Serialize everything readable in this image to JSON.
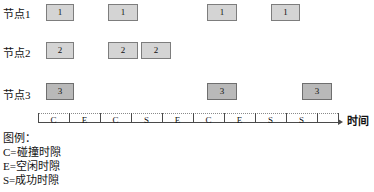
{
  "figure": {
    "type": "timing-diagram",
    "axis_label": "时间",
    "colors": {
      "node_box_fill": "#d4d4d4",
      "node3_box_fill": "#b9b9b9",
      "box_border": "#7d7d7d",
      "axis": "#4a4a4a",
      "text": "#111111",
      "background": "#ffffff"
    }
  },
  "rows": [
    {
      "label": "节点1",
      "label_x": 3,
      "label_y": 9,
      "box_y": 4,
      "box_h": 17,
      "node_id": "1",
      "style": "light",
      "boxes": [
        {
          "text": "1",
          "x": 46,
          "w": 28
        },
        {
          "text": "1",
          "x": 108,
          "w": 30
        },
        {
          "text": "1",
          "x": 207,
          "w": 30
        },
        {
          "text": "1",
          "x": 271,
          "w": 29
        }
      ]
    },
    {
      "label": "节点2",
      "label_x": 3,
      "label_y": 48,
      "box_y": 42,
      "box_h": 17,
      "node_id": "2",
      "style": "light",
      "boxes": [
        {
          "text": "2",
          "x": 46,
          "w": 28
        },
        {
          "text": "2",
          "x": 108,
          "w": 30
        },
        {
          "text": "2",
          "x": 141,
          "w": 30
        }
      ]
    },
    {
      "label": "节点3",
      "label_x": 3,
      "label_y": 90,
      "box_y": 83,
      "box_h": 17,
      "node_id": "3",
      "style": "dark",
      "boxes": [
        {
          "text": "3",
          "x": 46,
          "w": 28
        },
        {
          "text": "3",
          "x": 207,
          "w": 30
        },
        {
          "text": "3",
          "x": 302,
          "w": 30
        }
      ]
    }
  ],
  "timeline": {
    "axis_y": 122,
    "axis_x_start": 38,
    "axis_x_end": 338,
    "tick_top": 113,
    "tick_height": 10,
    "dotted_y": 113,
    "label_y": 116,
    "ticks": [
      38,
      69,
      100,
      131,
      162,
      193,
      224,
      255,
      286,
      317,
      338
    ],
    "slots": [
      {
        "label": "C",
        "x": 38,
        "w": 31
      },
      {
        "label": "E",
        "x": 69,
        "w": 31
      },
      {
        "label": "C",
        "x": 100,
        "w": 31
      },
      {
        "label": "S",
        "x": 131,
        "w": 31
      },
      {
        "label": "E",
        "x": 162,
        "w": 31
      },
      {
        "label": "C",
        "x": 193,
        "w": 31
      },
      {
        "label": "E",
        "x": 224,
        "w": 31
      },
      {
        "label": "S",
        "x": 255,
        "w": 31
      },
      {
        "label": "S",
        "x": 286,
        "w": 31
      }
    ],
    "arrow_x": 338,
    "arrow_y": 119,
    "time_label": "时间",
    "time_label_x": 347,
    "time_label_y": 116
  },
  "legend": {
    "x": 3,
    "title": "图例：",
    "title_y": 133,
    "items": [
      {
        "text": "C=碰撞时隙",
        "y": 147
      },
      {
        "text": "E=空闲时隙",
        "y": 161
      },
      {
        "text": "S=成功时隙",
        "y": 175
      }
    ]
  },
  "chart_data": {
    "type": "table",
    "xlabel": "时间",
    "ylabel": "",
    "categories": [
      "1",
      "2",
      "3",
      "4",
      "5",
      "6",
      "7",
      "8",
      "9"
    ],
    "slot_outcomes": [
      "C",
      "E",
      "C",
      "S",
      "E",
      "C",
      "E",
      "S",
      "S"
    ],
    "legend": [
      "C=碰撞时隙",
      "E=空闲时隙",
      "S=成功时隙"
    ],
    "series": [
      {
        "name": "节点1",
        "transmits_in_slots": [
          1,
          3,
          6,
          8
        ]
      },
      {
        "name": "节点2",
        "transmits_in_slots": [
          1,
          3,
          4
        ]
      },
      {
        "name": "节点3",
        "transmits_in_slots": [
          1,
          6,
          9
        ]
      }
    ]
  }
}
